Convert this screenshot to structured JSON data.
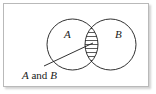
{
  "figure": {
    "type": "venn-diagram",
    "title": "",
    "background_color": "#ffffff",
    "border_color": "#b9b9b9",
    "stroke_color": "#1a1a1a",
    "hatch_color": "#4a4a4a"
  },
  "sets": [
    {
      "id": "set-a",
      "label": "A",
      "center_x": 72.5,
      "center_y": 44.5,
      "radius": 25.5
    },
    {
      "id": "set-b",
      "label": "B",
      "center_x": 110.5,
      "center_y": 44.5,
      "radius": 25.5
    }
  ],
  "intersection": {
    "name": "A and B",
    "fill_style": "horizontal-hatch",
    "hatch_line_count": 11,
    "shaded": true
  },
  "callout": {
    "text_parts": [
      {
        "text": "A",
        "italic": true
      },
      {
        "text": " and ",
        "italic": false
      },
      {
        "text": "B",
        "italic": true
      }
    ],
    "full_text": "A and B",
    "text_x": 22,
    "text_baseline_y": 79,
    "leader_line": {
      "from_x": 44,
      "from_y": 66,
      "to_x": 93,
      "to_y": 43
    }
  }
}
